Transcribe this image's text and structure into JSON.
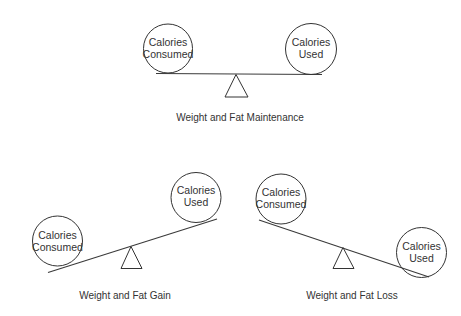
{
  "diagrams": {
    "maintenance": {
      "caption": "Weight and Fat Maintenance",
      "state": "balanced",
      "left_weight": {
        "line1": "Calories",
        "line2": "Consumed"
      },
      "right_weight": {
        "line1": "Calories",
        "line2": "Used"
      }
    },
    "gain": {
      "caption": "Weight and Fat Gain",
      "state": "tilted-left-down",
      "left_weight": {
        "line1": "Calories",
        "line2": "Consumed"
      },
      "right_weight": {
        "line1": "Calories",
        "line2": "Used"
      }
    },
    "loss": {
      "caption": "Weight and Fat Loss",
      "state": "tilted-right-down",
      "left_weight": {
        "line1": "Calories",
        "line2": "Consumed"
      },
      "right_weight": {
        "line1": "Calories",
        "line2": "Used"
      }
    }
  },
  "colors": {
    "stroke": "#333333",
    "background": "#ffffff"
  }
}
